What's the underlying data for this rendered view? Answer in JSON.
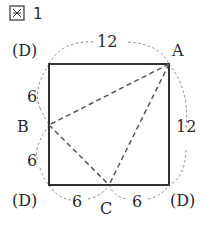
{
  "figure": {
    "title_kanji": "図",
    "title_number": "1"
  },
  "square": {
    "side_length": 12,
    "stroke_color": "#333333"
  },
  "points": {
    "A": "A",
    "B": "B",
    "C": "C"
  },
  "corner_labels": {
    "top_left": "(D)",
    "bottom_left": "(D)",
    "bottom_right": "(D)"
  },
  "measurements": {
    "top": "12",
    "right": "12",
    "left_upper": "6",
    "left_lower": "6",
    "bottom_left": "6",
    "bottom_right": "6"
  },
  "colors": {
    "solid_line": "#333333",
    "dashed_line": "#555555",
    "fold_arc": "#888888",
    "text": "#2a2a2a"
  }
}
